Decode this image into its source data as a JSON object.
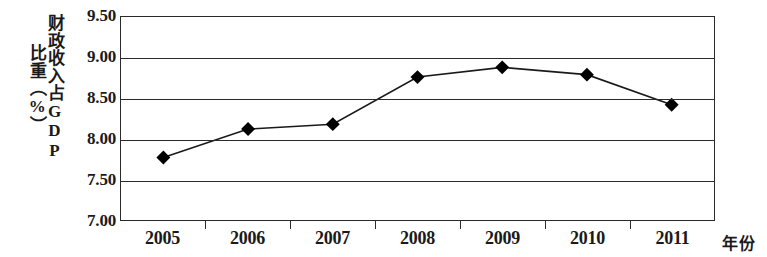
{
  "chart_data": {
    "type": "line",
    "title": "",
    "subtitle": "",
    "xlabel": "年份",
    "ylabel": "财政收入占GDP比重（%）",
    "ylabel_columns": [
      "财政收入占GDP",
      "比重（%）"
    ],
    "categories": [
      "2005",
      "2006",
      "2007",
      "2008",
      "2009",
      "2010",
      "2011"
    ],
    "x": [
      2005,
      2006,
      2007,
      2008,
      2009,
      2010,
      2011
    ],
    "values": [
      7.77,
      8.12,
      8.18,
      8.76,
      8.88,
      8.79,
      8.42
    ],
    "series": [
      {
        "name": "财政收入占GDP比重",
        "values": [
          7.77,
          8.12,
          8.18,
          8.76,
          8.88,
          8.79,
          8.42
        ]
      }
    ],
    "ylim": [
      7.0,
      9.5
    ],
    "ytick_labels": [
      "9.50",
      "9.00",
      "8.50",
      "8.00",
      "7.50",
      "7.00"
    ],
    "ytick_values": [
      9.5,
      9.0,
      8.5,
      8.0,
      7.5,
      7.0
    ],
    "xtick_labels": [
      "2005",
      "2006",
      "2007",
      "2008",
      "2009",
      "2010",
      "2011"
    ],
    "grid": true,
    "grid_axis": "y",
    "legend": false,
    "legend_position": "none",
    "marker": "diamond",
    "line_color": "#1a1a1a",
    "marker_color": "#000000",
    "background_color": "#ffffff",
    "annotations": []
  }
}
